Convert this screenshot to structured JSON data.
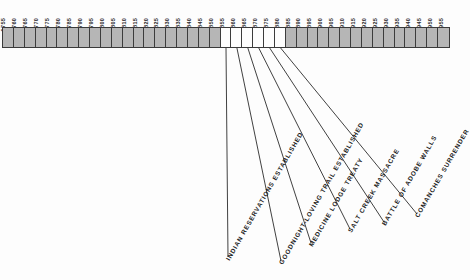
{
  "timeline": {
    "start_year": 1755,
    "end_year": 1955,
    "step": 5,
    "years": [
      "1755",
      "1760",
      "1765",
      "1770",
      "1775",
      "1780",
      "1785",
      "1790",
      "1795",
      "1800",
      "1805",
      "1810",
      "1815",
      "1820",
      "1825",
      "1830",
      "1835",
      "1840",
      "1845",
      "1850",
      "1855",
      "1860",
      "1865",
      "1870",
      "1875",
      "1880",
      "1885",
      "1890",
      "1895",
      "1900",
      "1905",
      "1910",
      "1915",
      "1920",
      "1925",
      "1930",
      "1935",
      "1940",
      "1945",
      "1950",
      "1955"
    ],
    "highlighted_years": [
      "1855",
      "1860",
      "1865",
      "1870",
      "1875",
      "1880"
    ],
    "colors": {
      "bar_fill": "#b6b6b6",
      "bar_highlight": "#fdfdfd",
      "bar_border": "#3c3c3c",
      "label_text": "#1e1e1e",
      "leader_line": "#2b2b2b",
      "background": "#fdfdfd"
    }
  },
  "events": [
    {
      "label": "INDIAN RESERVATIONS ESTABLISHED",
      "year": "1855"
    },
    {
      "label": "GOODNIGHT-LOVING TRAIL ESTABLISHED",
      "year": "1860"
    },
    {
      "label": "MEDICINE LODGE TREATY",
      "year": "1865"
    },
    {
      "label": "SALT CREEK MASSACRE",
      "year": "1870"
    },
    {
      "label": "BATTLE OF ADOBE WALLS",
      "year": "1875"
    },
    {
      "label": "COMANCHES SURRENDER",
      "year": "1880"
    }
  ]
}
